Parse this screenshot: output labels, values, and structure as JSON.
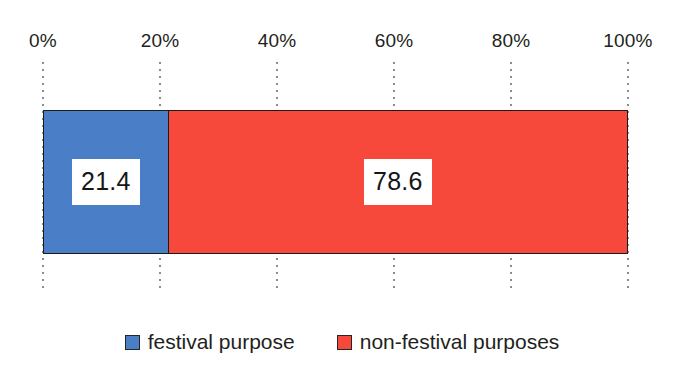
{
  "chart_data": {
    "type": "bar",
    "orientation": "horizontal",
    "stacked": true,
    "title": "",
    "subtitle": "",
    "xlabel": "",
    "ylabel": "",
    "categories": [
      ""
    ],
    "xlim": [
      0,
      100
    ],
    "grid": true,
    "legend_position": "bottom",
    "x_tick_labels": [
      "0%",
      "20%",
      "40%",
      "60%",
      "80%",
      "100%"
    ],
    "x_tick_values": [
      0,
      20,
      40,
      60,
      80,
      100
    ],
    "series": [
      {
        "name": "festival purpose",
        "values": [
          21.4
        ],
        "data_label": "21.4",
        "color": "#4a7ec6"
      },
      {
        "name": "non-festival purposes",
        "values": [
          78.6
        ],
        "data_label": "78.6",
        "color": "#f7493b"
      }
    ]
  },
  "axis": {
    "ticks": [
      {
        "label": "0%",
        "percent": 0
      },
      {
        "label": "20%",
        "percent": 20
      },
      {
        "label": "40%",
        "percent": 40
      },
      {
        "label": "60%",
        "percent": 60
      },
      {
        "label": "80%",
        "percent": 80
      },
      {
        "label": "100%",
        "percent": 100
      }
    ]
  },
  "bar": {
    "segments": [
      {
        "label": "21.4",
        "percent": 21.4,
        "color": "#4a7ec6",
        "series_name": "festival purpose"
      },
      {
        "label": "78.6",
        "percent": 78.6,
        "color": "#f7493b",
        "series_name": "non-festival purposes"
      }
    ]
  },
  "legend": {
    "items": [
      {
        "label": "festival purpose",
        "color": "#4a7ec6"
      },
      {
        "label": "non-festival purposes",
        "color": "#f7493b"
      }
    ]
  },
  "colors": {
    "series_blue": "#4a7ec6",
    "series_red": "#f7493b",
    "outline": "#1b1b1b",
    "gridline": "#8c8c8c",
    "text": "#231f20",
    "background": "#ffffff"
  }
}
